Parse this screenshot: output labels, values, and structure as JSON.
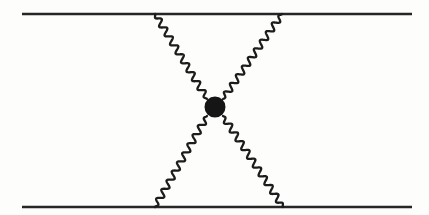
{
  "figure": {
    "background_color": "#fdfdfc",
    "width": 429,
    "height": 215
  },
  "style": {
    "fermion_color": "#262626",
    "fermion_width": 2.6,
    "boson_color": "#1c1c1c",
    "boson_width": 2.3,
    "vertex_color": "#151515"
  },
  "chart_data": {
    "type": "diagram",
    "vertex": {
      "label": "interaction-vertex",
      "x": 215,
      "y": 107,
      "radius": 10.5,
      "filled": true
    },
    "fermion_lines": [
      {
        "name": "top-fermion-line",
        "x1": 22,
        "y1": 14,
        "x2": 412,
        "y2": 14
      },
      {
        "name": "bottom-fermion-line",
        "x1": 22,
        "y1": 207,
        "x2": 412,
        "y2": 207
      }
    ],
    "boson_lines": [
      {
        "name": "upper-left-boson",
        "from_x": 155,
        "from_y": 14,
        "to_x": 207,
        "to_y": 99,
        "wave_amplitude": 3.1,
        "wavelength": 10.5
      },
      {
        "name": "upper-right-boson",
        "from_x": 282,
        "from_y": 14,
        "to_x": 223,
        "to_y": 99,
        "wave_amplitude": 3.1,
        "wavelength": 10.5
      },
      {
        "name": "lower-left-boson",
        "from_x": 155,
        "from_y": 207,
        "to_x": 207,
        "to_y": 116,
        "wave_amplitude": 3.1,
        "wavelength": 10.5
      },
      {
        "name": "lower-right-boson",
        "from_x": 283,
        "from_y": 207,
        "to_x": 223,
        "to_y": 116,
        "wave_amplitude": 3.1,
        "wavelength": 10.5
      }
    ]
  }
}
